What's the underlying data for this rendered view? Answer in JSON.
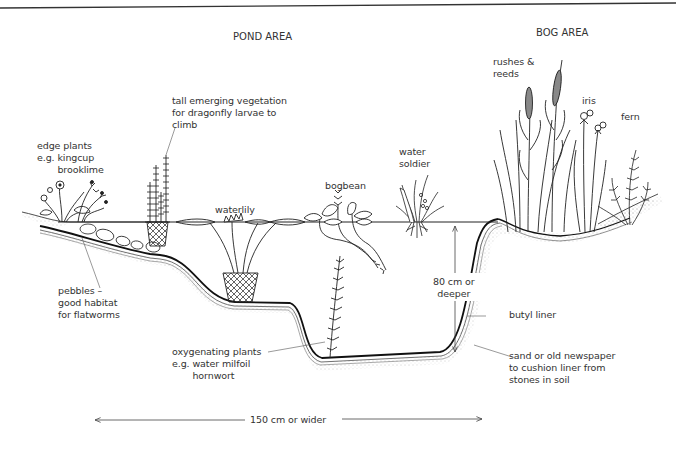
{
  "diagram": {
    "type": "cross-section",
    "areas": {
      "pond": "POND AREA",
      "bog": "BOG AREA"
    },
    "labels": {
      "edge_plants": "edge plants\ne.g. kingcup\n       brooklime",
      "tall_vegetation": "tall emerging vegetation\nfor dragonfly larvae to\nclimb",
      "waterlily": "waterlily",
      "bogbean": "bogbean",
      "water_soldier": "water\nsoldier",
      "rushes_reeds": "rushes &\nreeds",
      "iris": "iris",
      "fern": "fern",
      "pebbles": "pebbles –\ngood habitat\nfor flatworms",
      "oxygenating": "oxygenating plants\ne.g. water milfoil\n       hornwort",
      "depth": "80 cm or\ndeeper",
      "butyl_liner": "butyl liner",
      "sand_cushion": "sand or old newspaper\nto cushion liner from\nstones in soil",
      "width": "150 cm or wider"
    },
    "dimensions": {
      "depth": "80 cm or deeper",
      "width": "150 cm or wider"
    },
    "colors": {
      "ink": "#1a1a1a",
      "text": "#333333",
      "stipple": "#9a9a9a",
      "background": "#ffffff"
    }
  }
}
